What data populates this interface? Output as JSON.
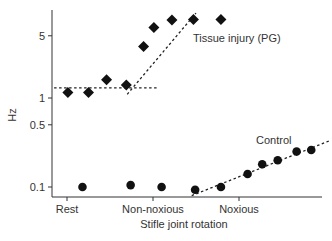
{
  "chart_data": {
    "type": "scatter",
    "title": "",
    "xlabel": "Stifle joint rotation",
    "ylabel": "Hz",
    "yscale": "log",
    "ylim": [
      0.08,
      8
    ],
    "yticks": [
      {
        "label": "5",
        "value": 5
      },
      {
        "label": "1",
        "value": 1
      },
      {
        "label": "0.5",
        "value": 0.5
      },
      {
        "label": "0.1",
        "value": 0.1
      }
    ],
    "xticks": [
      {
        "label": "Rest",
        "value": 0
      },
      {
        "label": "Non-noxious",
        "value": 1
      },
      {
        "label": "Noxious",
        "value": 2
      }
    ],
    "grid": false,
    "series": [
      {
        "name": "Tissue injury (PG)",
        "marker": "diamond",
        "x": [
          0.01,
          0.25,
          0.46,
          0.69,
          0.89,
          1.01,
          1.22,
          1.47,
          1.79
        ],
        "y": [
          1.15,
          1.15,
          1.6,
          1.4,
          3.8,
          6.2,
          7.5,
          7.6,
          7.6
        ],
        "fit": [
          {
            "x": [
              -0.15,
              1.05
            ],
            "y": [
              1.3,
              1.3
            ]
          },
          {
            "x": [
              0.7,
              1.5
            ],
            "y": [
              1.1,
              9.0
            ]
          }
        ]
      },
      {
        "name": "Control",
        "marker": "circle",
        "x": [
          0.18,
          0.74,
          1.1,
          1.49,
          1.79,
          2.1,
          2.27,
          2.45,
          2.67,
          2.84
        ],
        "y": [
          0.1,
          0.105,
          0.1,
          0.093,
          0.1,
          0.14,
          0.18,
          0.2,
          0.25,
          0.26
        ],
        "fit": [
          {
            "x": [
              1.45,
              3.05
            ],
            "y": [
              0.08,
              0.33
            ]
          }
        ]
      }
    ],
    "annotations": [
      {
        "text": "Tissue injury (PG)",
        "series": 0
      },
      {
        "text": "Control",
        "series": 1
      }
    ]
  }
}
